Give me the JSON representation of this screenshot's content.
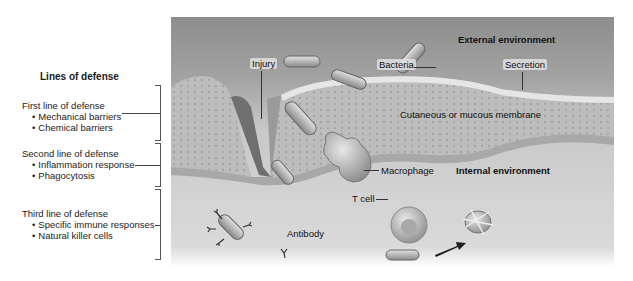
{
  "legend": {
    "title": "Lines of defense",
    "groups": [
      {
        "heading": "First line of defense",
        "items": [
          "Mechanical barriers",
          "Chemical barriers"
        ]
      },
      {
        "heading": "Second line of defense",
        "items": [
          "Inflammation response",
          "Phagocytosis"
        ]
      },
      {
        "heading": "Third line of defense",
        "items": [
          "Specific immune responses",
          "Natural killer cells"
        ]
      }
    ]
  },
  "illustration": {
    "labels": {
      "external_environment": "External environment",
      "internal_environment": "Internal environment",
      "injury": "Injury",
      "bacteria": "Bacteria",
      "secretion": "Secretion",
      "membrane": "Cutaneous or mucous membrane",
      "macrophage": "Macrophage",
      "t_cell": "T cell",
      "antibody": "Antibody"
    },
    "colors": {
      "external": "#8d8d8d",
      "membrane": "#b9b9b9",
      "internal": "#d2d2d2",
      "arrow": "#222222"
    }
  }
}
